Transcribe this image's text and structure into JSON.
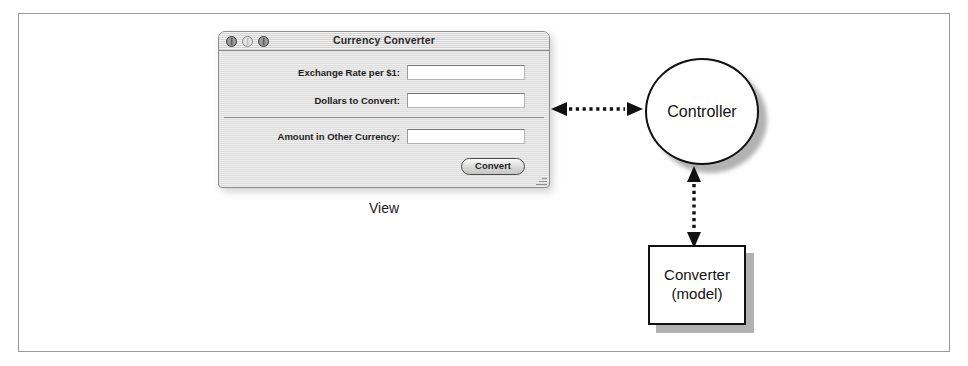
{
  "figure": {
    "domain_label": "MVC architecture diagram",
    "border_color": "#9a9a9a",
    "ink_color": "#111111",
    "shadow_color": "#b2b2b2"
  },
  "window": {
    "title": "Currency Converter",
    "traffic_lights": [
      {
        "name": "close",
        "label": "Close"
      },
      {
        "name": "minimize",
        "label": "Minimize"
      },
      {
        "name": "zoom",
        "label": "Zoom"
      }
    ],
    "fields": [
      {
        "label": "Exchange Rate per $1:",
        "value": "",
        "placeholder": ""
      },
      {
        "label": "Dollars to Convert:",
        "value": "",
        "placeholder": ""
      },
      {
        "label": "Amount in Other Currency:",
        "value": "",
        "placeholder": ""
      }
    ],
    "button": {
      "label": "Convert"
    },
    "grip_icon": "resize-grip-icon"
  },
  "captions": {
    "view": "View"
  },
  "nodes": {
    "controller": {
      "label": "Controller",
      "shape": "circle"
    },
    "model": {
      "line1": "Converter",
      "line2": "(model)",
      "shape": "rectangle"
    }
  },
  "connectors": [
    {
      "name": "view-controller",
      "style": "dotted",
      "heads": "both",
      "from": "View",
      "to": "Controller",
      "orientation": "horizontal"
    },
    {
      "name": "controller-model",
      "style": "dotted",
      "heads": "both",
      "from": "Controller",
      "to": "Converter (model)",
      "orientation": "vertical"
    }
  ]
}
